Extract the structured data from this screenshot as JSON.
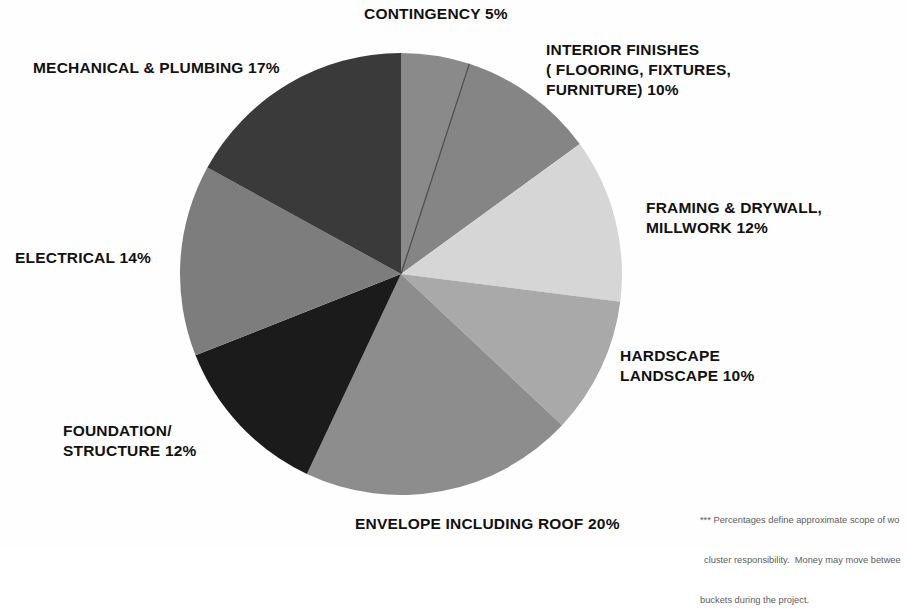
{
  "chart_data": {
    "type": "pie",
    "title": "",
    "subtitle": "",
    "xlabel": "",
    "ylabel": "",
    "legend_position": "none",
    "grid": false,
    "units": "percent",
    "total": 100,
    "start_angle_deg": 0,
    "direction": "clockwise",
    "categories": [
      "CONTINGENCY",
      "INTERIOR FINISHES ( FLOORING, FIXTURES, FURNITURE)",
      "FRAMING & DRYWALL, MILLWORK",
      "HARDSCAPE LANDSCAPE",
      "ENVELOPE INCLUDING ROOF",
      "FOUNDATION/ STRUCTURE",
      "ELECTRICAL",
      "MECHANICAL & PLUMBING"
    ],
    "values": [
      5,
      10,
      12,
      10,
      20,
      12,
      14,
      17
    ],
    "colors": [
      "#8a8a8a",
      "#858585",
      "#d6d6d6",
      "#a9a9a9",
      "#8d8d8d",
      "#1b1b1b",
      "#7d7d7d",
      "#3a3a3a"
    ],
    "slices": [
      {
        "label": "CONTINGENCY",
        "value": 5,
        "color": "#8a8a8a"
      },
      {
        "label": "INTERIOR FINISHES ( FLOORING, FIXTURES, FURNITURE)",
        "value": 10,
        "color": "#858585"
      },
      {
        "label": "FRAMING & DRYWALL, MILLWORK",
        "value": 12,
        "color": "#d6d6d6"
      },
      {
        "label": "HARDSCAPE LANDSCAPE",
        "value": 10,
        "color": "#a9a9a9"
      },
      {
        "label": "ENVELOPE INCLUDING ROOF",
        "value": 20,
        "color": "#8d8d8d"
      },
      {
        "label": "FOUNDATION/ STRUCTURE",
        "value": 12,
        "color": "#1b1b1b"
      },
      {
        "label": "ELECTRICAL",
        "value": 14,
        "color": "#7d7d7d"
      },
      {
        "label": "MECHANICAL & PLUMBING",
        "value": 17,
        "color": "#3a3a3a"
      }
    ],
    "annotations": [
      "*** Percentages define approximate scope of wo",
      "cluster responsibility.  Money may move betwee",
      "buckets during the project."
    ]
  },
  "labels": {
    "contingency": "CONTINGENCY 5%",
    "interior_finishes": "INTERIOR FINISHES\n( FLOORING, FIXTURES,\nFURNITURE) 10%",
    "framing_drywall": "FRAMING & DRYWALL,\nMILLWORK 12%",
    "hardscape_landscape": "HARDSCAPE\nLANDSCAPE 10%",
    "envelope_roof": "ENVELOPE INCLUDING ROOF   20%",
    "foundation_structure": "FOUNDATION/\nSTRUCTURE  12%",
    "electrical": "ELECTRICAL 14%",
    "mechanical_plumbing": "MECHANICAL & PLUMBING 17%"
  },
  "footnote": {
    "line1": "*** Percentages define approximate scope of wo",
    "line2": "cluster responsibility.  Money may move betwee",
    "line3": "buckets during the project."
  }
}
